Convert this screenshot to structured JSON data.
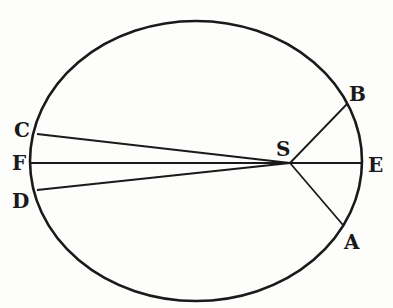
{
  "diagram": {
    "type": "ellipse-orbit-diagram",
    "stroke_color": "#1a1a1a",
    "background_color": "#fdfdfc",
    "ellipse": {
      "cx": 196,
      "cy": 161,
      "rx": 166,
      "ry": 140
    },
    "focus": {
      "label": "S",
      "x": 290,
      "y": 163
    },
    "points": [
      {
        "id": "A",
        "label": "A",
        "x": 343,
        "y": 225
      },
      {
        "id": "B",
        "label": "B",
        "x": 347,
        "y": 104
      },
      {
        "id": "C",
        "label": "C",
        "x": 37,
        "y": 134
      },
      {
        "id": "D",
        "label": "D",
        "x": 37,
        "y": 190
      },
      {
        "id": "E",
        "label": "E",
        "x": 362,
        "y": 163
      },
      {
        "id": "F",
        "label": "F",
        "x": 30,
        "y": 163
      }
    ],
    "segments": [
      {
        "from": "S",
        "to": "A"
      },
      {
        "from": "S",
        "to": "B"
      },
      {
        "from": "S",
        "to": "C"
      },
      {
        "from": "S",
        "to": "D"
      },
      {
        "from": "F",
        "to": "E"
      }
    ],
    "labels": {
      "S": "S",
      "A": "A",
      "B": "B",
      "C": "C",
      "D": "D",
      "E": "E",
      "F": "F"
    }
  }
}
